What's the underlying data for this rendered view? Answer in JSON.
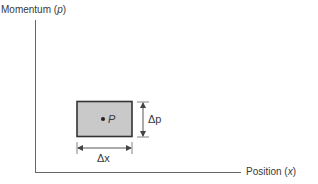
{
  "diagram": {
    "y_axis": {
      "label": "Momentum",
      "symbol": "p"
    },
    "x_axis": {
      "label": "Position",
      "symbol": "x"
    },
    "cell": {
      "point_label": "P",
      "width_label": "Δx",
      "height_label": "Δp",
      "fill_color": "#c8c8c8",
      "border_color": "#333333"
    }
  }
}
